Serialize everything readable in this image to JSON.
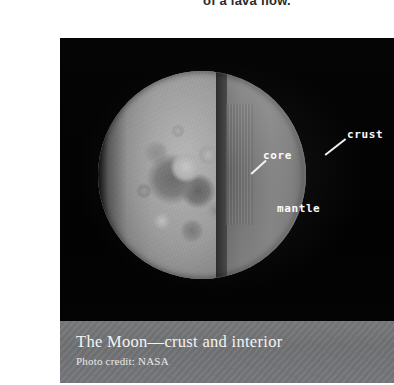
{
  "page": {
    "heading_clipped": "of a lava flow."
  },
  "figure": {
    "background_color": "#030303",
    "annotations": [
      {
        "id": "crust",
        "label": "crust",
        "has_leader_line": true
      },
      {
        "id": "core",
        "label": "core",
        "has_leader_line": true
      },
      {
        "id": "mantle",
        "label": "mantle",
        "has_leader_line": false
      }
    ],
    "annotation_color": "#fbfbfb",
    "caption": {
      "title": "The Moon—crust and interior",
      "credit": "Photo credit: NASA",
      "band_color": "#727476",
      "text_color": "#f4f4f4"
    }
  }
}
